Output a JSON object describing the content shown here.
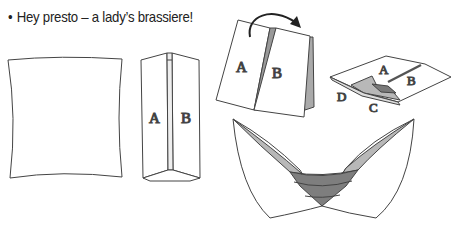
{
  "caption": {
    "bullet": "•",
    "text": "Hey presto – a lady’s brassiere!"
  },
  "diagram": {
    "steps": [
      {
        "id": "flat-square",
        "labels": []
      },
      {
        "id": "folded-panels",
        "labels": [
          "A",
          "B"
        ]
      },
      {
        "id": "fold-over",
        "labels": [
          "A",
          "B"
        ],
        "arrow": "curved-arrow"
      },
      {
        "id": "flattened",
        "labels": [
          "A",
          "B",
          "C",
          "D"
        ]
      },
      {
        "id": "brassiere",
        "labels": []
      }
    ],
    "labels": {
      "panel_a": "A",
      "panel_b": "B",
      "corner_c": "C",
      "corner_d": "D"
    },
    "colors": {
      "line": "#444444",
      "shade_light": "#b8b8b8",
      "shade_mid": "#8a8a8a",
      "shade_dark": "#6e6e6e"
    }
  }
}
